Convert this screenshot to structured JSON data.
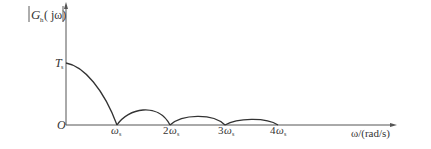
{
  "diagram": {
    "y_axis": {
      "label_main": "G",
      "label_sub": "h",
      "label_arg": "( jω)",
      "tick_label": "T",
      "tick_sub": "s"
    },
    "x_axis": {
      "label": "ω/(rad/s)",
      "origin": "O",
      "ticks": [
        {
          "coef": "",
          "sym": "ω",
          "sub": "s"
        },
        {
          "coef": "2",
          "sym": "ω",
          "sub": "s"
        },
        {
          "coef": "3",
          "sym": "ω",
          "sub": "s"
        },
        {
          "coef": "4",
          "sym": "ω",
          "sub": "s"
        }
      ]
    },
    "colors": {
      "axis": "#555555",
      "curve": "#333333",
      "text": "#333333"
    }
  }
}
